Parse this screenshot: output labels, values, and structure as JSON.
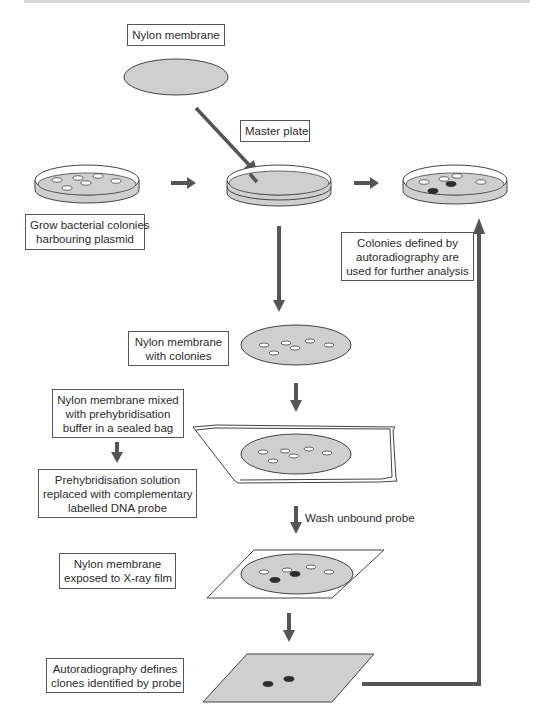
{
  "diagram": {
    "colors": {
      "arrow": "#555555",
      "membrane_fill": "#cfcfcf",
      "outline": "#444444",
      "positive_colony": "#2e2e2e",
      "colony_fill": "#ffffff"
    },
    "labels": {
      "nylon_membrane": "Nylon membrane",
      "master_plate": "Master plate",
      "grow_colonies": [
        "Grow bacterial colonies",
        "harbouring plasmid"
      ],
      "colonies_defined": [
        "Colonies defined by",
        "autoradiography are",
        "used for further analysis"
      ],
      "membrane_with_colonies": [
        "Nylon membrane",
        "with colonies"
      ],
      "membrane_mixed": [
        "Nylon membrane mixed",
        "with prehybridisation",
        "buffer in a sealed bag"
      ],
      "prehyb_replaced": [
        "Prehybridisation solution",
        "replaced with complementary",
        "labelled DNA probe"
      ],
      "wash_unbound": "Wash unbound probe",
      "membrane_exposed": [
        "Nylon membrane",
        "exposed to X-ray film"
      ],
      "autoradiography_defines": [
        "Autoradiography defines",
        "clones identified by probe"
      ]
    },
    "steps": [
      {
        "id": "grow",
        "label_ref": "grow_colonies"
      },
      {
        "id": "master-plate",
        "label_ref": "master_plate"
      },
      {
        "id": "membrane-with-colonies",
        "label_ref": "membrane_with_colonies"
      },
      {
        "id": "sealed-bag",
        "label_ref": "membrane_mixed"
      },
      {
        "id": "probe",
        "label_ref": "prehyb_replaced"
      },
      {
        "id": "wash",
        "label_ref": "wash_unbound"
      },
      {
        "id": "xray",
        "label_ref": "membrane_exposed"
      },
      {
        "id": "autoradiography",
        "label_ref": "autoradiography_defines"
      },
      {
        "id": "further-analysis",
        "label_ref": "colonies_defined"
      }
    ]
  }
}
